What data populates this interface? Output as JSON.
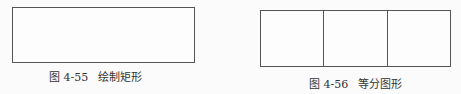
{
  "figures": [
    {
      "id": "fig-4-55",
      "shape": "rectangle",
      "caption": {
        "number": "图 4-55",
        "title": "绘制矩形"
      }
    },
    {
      "id": "fig-4-56",
      "shape": "rectangle divided into 3 equal parts",
      "divisions": 3,
      "caption": {
        "number": "图 4-56",
        "title": "等分图形"
      }
    }
  ]
}
